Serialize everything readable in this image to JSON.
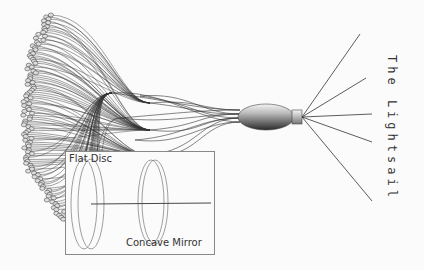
{
  "diagram": {
    "title": "The Lightsail",
    "inset": {
      "labels": {
        "flat_disc": "Flat Disc",
        "concave_mirror": "Concave Mirror"
      }
    },
    "colors": {
      "line": "#333333",
      "background": "#fbfbfb",
      "inset_border": "#888888"
    },
    "components": [
      "tethered discs",
      "converging tethers",
      "craft body",
      "sail rigging rays"
    ],
    "sail_ray_count": 5
  }
}
